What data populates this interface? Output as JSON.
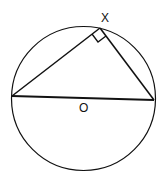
{
  "diagram": {
    "type": "geometry",
    "labels": {
      "vertex": "X",
      "center": "O"
    },
    "circle": {
      "cx": 83.5,
      "cy": 98.5,
      "r": 72
    },
    "points": {
      "left": [
        12,
        96
      ],
      "right": [
        154,
        100
      ],
      "x": [
        100,
        28
      ]
    },
    "right_angle_marker": true,
    "colors": {
      "stroke": "#111111",
      "background": "#ffffff"
    }
  }
}
